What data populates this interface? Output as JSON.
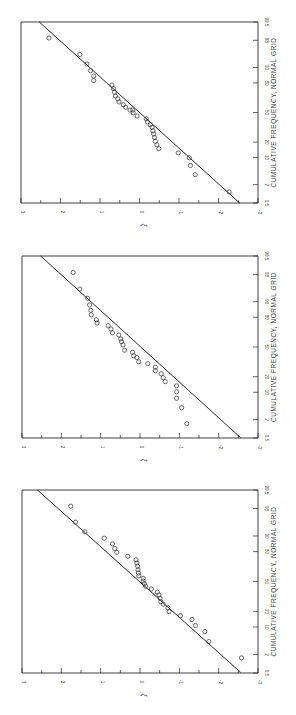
{
  "figure": {
    "orientation": "rotated 90deg clockwise (page printed sideways)",
    "xlabel": "CUMULATIVE FREQUENCY, NORMAL GRID",
    "ylabel": "ξ",
    "freq_ticks": [
      "0.5",
      "2",
      "10",
      "20",
      "50",
      "80",
      "90",
      "98",
      "99.5"
    ],
    "xi_ticks": [
      "3",
      "2",
      "1",
      "0",
      "-1",
      "-2",
      "-3"
    ],
    "marker": "open-circle",
    "line_color": "#2a2a2a",
    "marker_color": "#3a3a3a"
  },
  "chart_data": [
    {
      "type": "scatter",
      "title": "",
      "xlabel": "CUMULATIVE FREQUENCY, NORMAL GRID",
      "ylabel": "ξ",
      "xscale": "normal-probability",
      "xlim": [
        0.5,
        99.5
      ],
      "ylim": [
        -3,
        3
      ],
      "xticks": [
        0.5,
        2,
        10,
        20,
        50,
        80,
        90,
        98,
        99.5
      ],
      "yticks": [
        -3,
        -2,
        -1,
        0,
        1,
        2,
        3
      ],
      "grid": false,
      "frame": {
        "left": 21,
        "right": 258,
        "top": 22,
        "bottom": 203
      },
      "reference_line": {
        "xi": [
          2.54,
          -2.54
        ],
        "z": [
          2.58,
          -2.58
        ]
      },
      "points_xi_z": [
        [
          2.29,
          2.12
        ],
        [
          1.51,
          1.65
        ],
        [
          1.33,
          1.38
        ],
        [
          1.24,
          1.19
        ],
        [
          1.16,
          1.04
        ],
        [
          1.16,
          0.91
        ],
        [
          0.7,
          0.78
        ],
        [
          0.66,
          0.68
        ],
        [
          0.63,
          0.58
        ],
        [
          0.61,
          0.47
        ],
        [
          0.55,
          0.39
        ],
        [
          0.52,
          0.3
        ],
        [
          0.41,
          0.22
        ],
        [
          0.35,
          0.15
        ],
        [
          0.24,
          0.07
        ],
        [
          0.17,
          0.07
        ],
        [
          0.16,
          -0.01
        ],
        [
          0.06,
          -0.1
        ],
        [
          -0.17,
          -0.18
        ],
        [
          -0.2,
          -0.27
        ],
        [
          -0.27,
          -0.35
        ],
        [
          -0.32,
          -0.42
        ],
        [
          -0.34,
          -0.52
        ],
        [
          -0.36,
          -0.61
        ],
        [
          -0.38,
          -0.71
        ],
        [
          -0.4,
          -0.82
        ],
        [
          -0.44,
          -0.92
        ],
        [
          -0.49,
          -1.03
        ],
        [
          -0.98,
          -1.15
        ],
        [
          -1.26,
          -1.29
        ],
        [
          -1.29,
          -1.51
        ],
        [
          -1.41,
          -1.77
        ],
        [
          -2.27,
          -2.26
        ]
      ]
    },
    {
      "type": "scatter",
      "title": "",
      "xlabel": "CUMULATIVE FREQUENCY, NORMAL GRID",
      "ylabel": "ξ",
      "xscale": "normal-probability",
      "xlim": [
        0.5,
        99.5
      ],
      "ylim": [
        -3,
        3
      ],
      "xticks": [
        0.5,
        2,
        10,
        20,
        50,
        80,
        90,
        98,
        99.5
      ],
      "yticks": [
        -3,
        -2,
        -1,
        0,
        1,
        2,
        3
      ],
      "grid": false,
      "frame": {
        "left": 22,
        "right": 258,
        "top": 256,
        "bottom": 438
      },
      "reference_line": {
        "xi": [
          2.53,
          -2.56
        ],
        "z": [
          2.58,
          -2.57
        ]
      },
      "points_xi_z": [
        [
          1.7,
          2.11
        ],
        [
          1.53,
          1.64
        ],
        [
          1.33,
          1.38
        ],
        [
          1.28,
          1.19
        ],
        [
          1.25,
          1.04
        ],
        [
          1.24,
          0.91
        ],
        [
          1.11,
          0.77
        ],
        [
          1.09,
          0.68
        ],
        [
          0.81,
          0.6
        ],
        [
          0.74,
          0.51
        ],
        [
          0.7,
          0.4
        ],
        [
          0.54,
          0.34
        ],
        [
          0.49,
          0.23
        ],
        [
          0.47,
          0.15
        ],
        [
          0.43,
          0.06
        ],
        [
          0.39,
          -0.09
        ],
        [
          0.19,
          -0.15
        ],
        [
          0.16,
          -0.25
        ],
        [
          0.08,
          -0.3
        ],
        [
          0.03,
          -0.42
        ],
        [
          -0.2,
          -0.47
        ],
        [
          -0.39,
          -0.57
        ],
        [
          -0.39,
          -0.67
        ],
        [
          -0.54,
          -0.76
        ],
        [
          -0.59,
          -0.87
        ],
        [
          -0.64,
          -0.98
        ],
        [
          -0.93,
          -1.1
        ],
        [
          -0.93,
          -1.27
        ],
        [
          -0.93,
          -1.45
        ],
        [
          -1.06,
          -1.72
        ],
        [
          -1.19,
          -2.17
        ]
      ]
    },
    {
      "type": "scatter",
      "title": "",
      "xlabel": "CUMULATIVE FREQUENCY, NORMAL GRID",
      "ylabel": "ξ",
      "xscale": "normal-probability",
      "xlim": [
        0.5,
        99.5
      ],
      "ylim": [
        -3,
        3
      ],
      "xticks": [
        0.5,
        2,
        10,
        20,
        50,
        80,
        90,
        98,
        99.5
      ],
      "yticks": [
        -3,
        -2,
        -1,
        0,
        1,
        2,
        3
      ],
      "grid": false,
      "frame": {
        "left": 22,
        "right": 258,
        "top": 490,
        "bottom": 673
      },
      "reference_line": {
        "xi": [
          2.61,
          -2.56
        ],
        "z": [
          2.58,
          -2.56
        ]
      },
      "points_xi_z": [
        [
          1.76,
          2.12
        ],
        [
          1.64,
          1.67
        ],
        [
          1.4,
          1.4
        ],
        [
          0.91,
          1.22
        ],
        [
          0.7,
          1.06
        ],
        [
          0.64,
          0.93
        ],
        [
          0.59,
          0.82
        ],
        [
          0.31,
          0.71
        ],
        [
          0.1,
          0.61
        ],
        [
          0.08,
          0.52
        ],
        [
          0.06,
          0.43
        ],
        [
          0.05,
          0.33
        ],
        [
          0.04,
          0.24
        ],
        [
          0.03,
          0.16
        ],
        [
          -0.08,
          0.09
        ],
        [
          -0.08,
          0.01
        ],
        [
          -0.11,
          -0.06
        ],
        [
          -0.14,
          -0.13
        ],
        [
          -0.29,
          -0.21
        ],
        [
          -0.44,
          -0.3
        ],
        [
          -0.48,
          -0.38
        ],
        [
          -0.51,
          -0.47
        ],
        [
          -0.53,
          -0.57
        ],
        [
          -0.59,
          -0.64
        ],
        [
          -0.71,
          -0.74
        ],
        [
          -0.74,
          -0.85
        ],
        [
          -1.03,
          -0.96
        ],
        [
          -1.32,
          -1.07
        ],
        [
          -1.41,
          -1.24
        ],
        [
          -1.65,
          -1.41
        ],
        [
          -1.75,
          -1.69
        ],
        [
          -2.58,
          -2.15
        ]
      ]
    }
  ]
}
